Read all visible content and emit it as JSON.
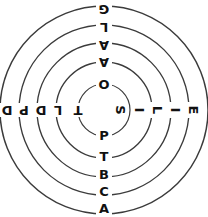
{
  "figure": {
    "type": "concentric-ring-letter-diagram",
    "background_color": "#ffffff",
    "stroke_color": "#3b3b3b",
    "text_color": "#111111",
    "center": {
      "x": 104,
      "y": 110
    },
    "ring_radii": [
      26,
      48,
      67,
      85,
      104
    ]
  },
  "labels": {
    "top": [
      "O",
      "A",
      "A",
      "L",
      "G"
    ],
    "bottom": [
      "P",
      "T",
      "B",
      "C",
      "A"
    ],
    "left": [
      "T",
      "L",
      "D",
      "P",
      "D"
    ],
    "right": [
      "S",
      "I",
      "L",
      "I",
      "E"
    ]
  },
  "positions": {
    "top": [
      {
        "x": 104,
        "y": 84
      },
      {
        "x": 104,
        "y": 62
      },
      {
        "x": 104,
        "y": 45
      },
      {
        "x": 104,
        "y": 27
      },
      {
        "x": 104,
        "y": 9
      }
    ],
    "bottom": [
      {
        "x": 104,
        "y": 136
      },
      {
        "x": 104,
        "y": 157
      },
      {
        "x": 104,
        "y": 175
      },
      {
        "x": 104,
        "y": 192
      },
      {
        "x": 104,
        "y": 209
      }
    ],
    "left": [
      {
        "x": 78,
        "y": 110
      },
      {
        "x": 58,
        "y": 110
      },
      {
        "x": 41,
        "y": 110
      },
      {
        "x": 24,
        "y": 110
      },
      {
        "x": 7,
        "y": 110
      }
    ],
    "right": [
      {
        "x": 120,
        "y": 110
      },
      {
        "x": 139,
        "y": 110
      },
      {
        "x": 157,
        "y": 110
      },
      {
        "x": 175,
        "y": 110
      },
      {
        "x": 193,
        "y": 110
      }
    ]
  }
}
